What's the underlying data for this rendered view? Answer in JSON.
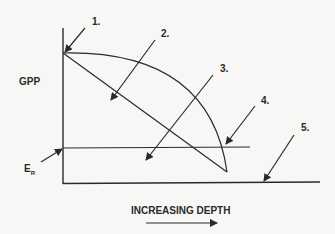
{
  "diagram": {
    "y_axis_label": "GPP",
    "er_label_main": "E",
    "er_label_sub": "R",
    "x_axis_label": "INCREASING DEPTH",
    "callouts": [
      {
        "id": 1,
        "label": "1."
      },
      {
        "id": 2,
        "label": "2."
      },
      {
        "id": 3,
        "label": "3."
      },
      {
        "id": 4,
        "label": "4."
      },
      {
        "id": 5,
        "label": "5."
      }
    ],
    "colors": {
      "background": "#f7f7f5",
      "ink": "#2a2a2a"
    }
  }
}
